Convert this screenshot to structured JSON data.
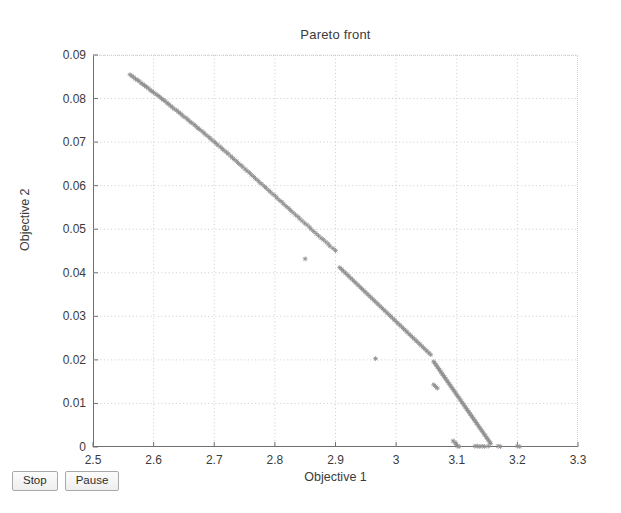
{
  "window": {
    "background_color": "#ffffff"
  },
  "chart_data": {
    "type": "scatter",
    "title": "Pareto front",
    "xlabel": "Objective 1",
    "ylabel": "Objective 2",
    "xlim": [
      2.5,
      3.3
    ],
    "ylim": [
      0,
      0.09
    ],
    "xticks": [
      2.5,
      2.6,
      2.7,
      2.8,
      2.9,
      3.0,
      3.1,
      3.2,
      3.3
    ],
    "xtick_labels": [
      "2.5",
      "2.6",
      "2.7",
      "2.8",
      "2.9",
      "3",
      "3.1",
      "3.2",
      "3.3"
    ],
    "yticks": [
      0,
      0.01,
      0.02,
      0.03,
      0.04,
      0.05,
      0.06,
      0.07,
      0.08,
      0.09
    ],
    "ytick_labels": [
      "0",
      "0.01",
      "0.02",
      "0.03",
      "0.04",
      "0.05",
      "0.06",
      "0.07",
      "0.08",
      "0.09"
    ],
    "grid": true,
    "grid_style": "dotted",
    "grid_color": "#cccccc",
    "legend": null,
    "marker": "asterisk",
    "marker_color": "#8c8c8c",
    "marker_size": 4,
    "series": [
      {
        "name": "Pareto front",
        "points": [
          [
            2.561,
            0.0855
          ],
          [
            2.564,
            0.0852
          ],
          [
            2.567,
            0.0849
          ],
          [
            2.57,
            0.0845
          ],
          [
            2.573,
            0.0843
          ],
          [
            2.576,
            0.084
          ],
          [
            2.579,
            0.0836
          ],
          [
            2.582,
            0.0833
          ],
          [
            2.585,
            0.083
          ],
          [
            2.588,
            0.0827
          ],
          [
            2.591,
            0.0824
          ],
          [
            2.594,
            0.082
          ],
          [
            2.597,
            0.0817
          ],
          [
            2.6,
            0.0814
          ],
          [
            2.604,
            0.081
          ],
          [
            2.607,
            0.0807
          ],
          [
            2.61,
            0.0804
          ],
          [
            2.613,
            0.08
          ],
          [
            2.616,
            0.0797
          ],
          [
            2.619,
            0.0794
          ],
          [
            2.622,
            0.079
          ],
          [
            2.625,
            0.0787
          ],
          [
            2.628,
            0.0783
          ],
          [
            2.631,
            0.078
          ],
          [
            2.634,
            0.0776
          ],
          [
            2.638,
            0.0773
          ],
          [
            2.641,
            0.0769
          ],
          [
            2.644,
            0.0766
          ],
          [
            2.647,
            0.0762
          ],
          [
            2.65,
            0.0758
          ],
          [
            2.654,
            0.0755
          ],
          [
            2.657,
            0.0751
          ],
          [
            2.66,
            0.0747
          ],
          [
            2.663,
            0.0744
          ],
          [
            2.667,
            0.074
          ],
          [
            2.67,
            0.0736
          ],
          [
            2.673,
            0.0732
          ],
          [
            2.676,
            0.0729
          ],
          [
            2.68,
            0.0725
          ],
          [
            2.683,
            0.0721
          ],
          [
            2.686,
            0.0717
          ],
          [
            2.69,
            0.0713
          ],
          [
            2.693,
            0.0709
          ],
          [
            2.696,
            0.0705
          ],
          [
            2.7,
            0.0701
          ],
          [
            2.703,
            0.0697
          ],
          [
            2.706,
            0.0693
          ],
          [
            2.71,
            0.0689
          ],
          [
            2.713,
            0.0685
          ],
          [
            2.716,
            0.0681
          ],
          [
            2.72,
            0.0677
          ],
          [
            2.723,
            0.0673
          ],
          [
            2.727,
            0.0668
          ],
          [
            2.73,
            0.0664
          ],
          [
            2.733,
            0.066
          ],
          [
            2.737,
            0.0656
          ],
          [
            2.74,
            0.0651
          ],
          [
            2.744,
            0.0647
          ],
          [
            2.747,
            0.0643
          ],
          [
            2.751,
            0.0638
          ],
          [
            2.754,
            0.0634
          ],
          [
            2.758,
            0.063
          ],
          [
            2.761,
            0.0625
          ],
          [
            2.765,
            0.0621
          ],
          [
            2.768,
            0.0616
          ],
          [
            2.772,
            0.0612
          ],
          [
            2.775,
            0.0607
          ],
          [
            2.779,
            0.0603
          ],
          [
            2.783,
            0.0598
          ],
          [
            2.786,
            0.0594
          ],
          [
            2.79,
            0.0589
          ],
          [
            2.793,
            0.0585
          ],
          [
            2.797,
            0.058
          ],
          [
            2.801,
            0.0576
          ],
          [
            2.804,
            0.0571
          ],
          [
            2.808,
            0.0566
          ],
          [
            2.812,
            0.0562
          ],
          [
            2.815,
            0.0557
          ],
          [
            2.819,
            0.0552
          ],
          [
            2.823,
            0.0548
          ],
          [
            2.826,
            0.0543
          ],
          [
            2.83,
            0.0538
          ],
          [
            2.834,
            0.0533
          ],
          [
            2.838,
            0.0529
          ],
          [
            2.841,
            0.0524
          ],
          [
            2.845,
            0.0519
          ],
          [
            2.849,
            0.0514
          ],
          [
            2.853,
            0.051
          ],
          [
            2.857,
            0.0505
          ],
          [
            2.86,
            0.05
          ],
          [
            2.864,
            0.0495
          ],
          [
            2.868,
            0.049
          ],
          [
            2.872,
            0.0485
          ],
          [
            2.876,
            0.048
          ],
          [
            2.88,
            0.0476
          ],
          [
            2.884,
            0.0471
          ],
          [
            2.888,
            0.0466
          ],
          [
            2.891,
            0.0461
          ],
          [
            2.896,
            0.0456
          ],
          [
            2.9,
            0.0451
          ],
          [
            2.85,
            0.0432
          ],
          [
            2.907,
            0.0412
          ],
          [
            2.91,
            0.0408
          ],
          [
            2.913,
            0.0404
          ],
          [
            2.916,
            0.04
          ],
          [
            2.919,
            0.0396
          ],
          [
            2.922,
            0.0392
          ],
          [
            2.925,
            0.0388
          ],
          [
            2.928,
            0.0384
          ],
          [
            2.931,
            0.038
          ],
          [
            2.934,
            0.0376
          ],
          [
            2.937,
            0.0372
          ],
          [
            2.94,
            0.0368
          ],
          [
            2.943,
            0.0364
          ],
          [
            2.946,
            0.036
          ],
          [
            2.949,
            0.0356
          ],
          [
            2.952,
            0.0352
          ],
          [
            2.955,
            0.0348
          ],
          [
            2.958,
            0.0344
          ],
          [
            2.961,
            0.034
          ],
          [
            2.964,
            0.0336
          ],
          [
            2.967,
            0.0332
          ],
          [
            2.97,
            0.0328
          ],
          [
            2.973,
            0.0324
          ],
          [
            2.976,
            0.032
          ],
          [
            2.979,
            0.0316
          ],
          [
            2.982,
            0.0312
          ],
          [
            2.985,
            0.0308
          ],
          [
            2.988,
            0.0304
          ],
          [
            2.991,
            0.03
          ],
          [
            2.994,
            0.0296
          ],
          [
            2.997,
            0.0292
          ],
          [
            3.0,
            0.0288
          ],
          [
            3.003,
            0.0284
          ],
          [
            3.006,
            0.028
          ],
          [
            3.009,
            0.0276
          ],
          [
            3.012,
            0.0272
          ],
          [
            3.015,
            0.0268
          ],
          [
            3.018,
            0.0264
          ],
          [
            3.021,
            0.026
          ],
          [
            3.024,
            0.0256
          ],
          [
            3.027,
            0.0252
          ],
          [
            3.03,
            0.0248
          ],
          [
            3.033,
            0.0244
          ],
          [
            3.036,
            0.024
          ],
          [
            3.039,
            0.0236
          ],
          [
            3.042,
            0.0232
          ],
          [
            3.045,
            0.0228
          ],
          [
            3.048,
            0.0224
          ],
          [
            3.051,
            0.022
          ],
          [
            3.054,
            0.0216
          ],
          [
            3.057,
            0.0212
          ],
          [
            2.966,
            0.0203
          ],
          [
            3.062,
            0.0196
          ],
          [
            3.064,
            0.0192
          ],
          [
            3.066,
            0.0188
          ],
          [
            3.068,
            0.0184
          ],
          [
            3.07,
            0.018
          ],
          [
            3.072,
            0.0176
          ],
          [
            3.074,
            0.0172
          ],
          [
            3.076,
            0.0168
          ],
          [
            3.078,
            0.0164
          ],
          [
            3.08,
            0.016
          ],
          [
            3.082,
            0.0156
          ],
          [
            3.084,
            0.0152
          ],
          [
            3.086,
            0.0148
          ],
          [
            3.088,
            0.0144
          ],
          [
            3.09,
            0.014
          ],
          [
            3.092,
            0.0136
          ],
          [
            3.094,
            0.0132
          ],
          [
            3.096,
            0.0128
          ],
          [
            3.098,
            0.0124
          ],
          [
            3.1,
            0.012
          ],
          [
            3.062,
            0.0143
          ],
          [
            3.065,
            0.0139
          ],
          [
            3.068,
            0.0135
          ],
          [
            3.102,
            0.0116
          ],
          [
            3.104,
            0.0112
          ],
          [
            3.106,
            0.0108
          ],
          [
            3.108,
            0.0104
          ],
          [
            3.11,
            0.01
          ],
          [
            3.112,
            0.0096
          ],
          [
            3.114,
            0.0092
          ],
          [
            3.116,
            0.0088
          ],
          [
            3.118,
            0.0084
          ],
          [
            3.12,
            0.008
          ],
          [
            3.122,
            0.0076
          ],
          [
            3.124,
            0.0072
          ],
          [
            3.126,
            0.0068
          ],
          [
            3.128,
            0.0064
          ],
          [
            3.13,
            0.006
          ],
          [
            3.132,
            0.0056
          ],
          [
            3.134,
            0.0052
          ],
          [
            3.136,
            0.0048
          ],
          [
            3.138,
            0.0044
          ],
          [
            3.14,
            0.004
          ],
          [
            3.142,
            0.0036
          ],
          [
            3.144,
            0.0032
          ],
          [
            3.146,
            0.0028
          ],
          [
            3.148,
            0.0024
          ],
          [
            3.15,
            0.002
          ],
          [
            3.152,
            0.0016
          ],
          [
            3.154,
            0.0012
          ],
          [
            3.156,
            0.0008
          ],
          [
            3.094,
            0.0014
          ],
          [
            3.097,
            0.001
          ],
          [
            3.099,
            0.0006
          ],
          [
            3.101,
            0.0002
          ],
          [
            3.104,
            0.0001
          ],
          [
            3.13,
            0.0002
          ],
          [
            3.134,
            0.0002
          ],
          [
            3.138,
            0.0001
          ],
          [
            3.142,
            0.0002
          ],
          [
            3.146,
            0.0001
          ],
          [
            3.152,
            0.0002
          ],
          [
            3.168,
            0.0002
          ],
          [
            3.172,
            0.0001
          ],
          [
            3.2,
            0.0002
          ],
          [
            3.204,
            0.0001
          ]
        ]
      }
    ]
  },
  "controls": {
    "stop_label": "Stop",
    "pause_label": "Pause"
  }
}
